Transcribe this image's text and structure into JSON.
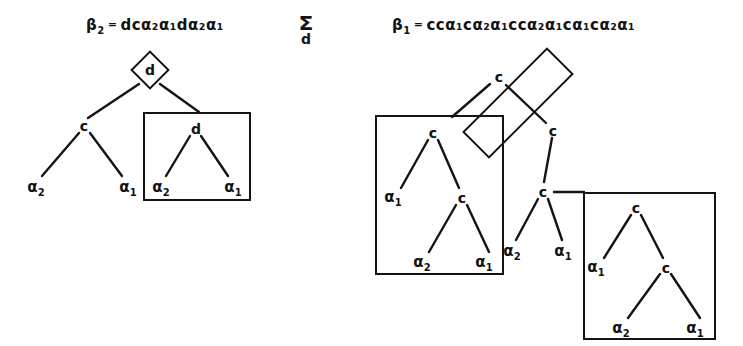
{
  "figure": {
    "left_diagram": {
      "equation": {
        "lhs": "β",
        "lhs_sub": "2",
        "equals": "=",
        "rhs": "dcα₂α₁dα₂α₁",
        "rhs_plain": "dca2a1da2a1"
      },
      "root_node": "d",
      "root_shape": "diamond",
      "nodes": [
        {
          "id": "L-root",
          "label": "d",
          "shape": "diamond"
        },
        {
          "id": "L-c",
          "label": "c",
          "shape": "plain"
        },
        {
          "id": "L-a2",
          "label": "α",
          "sub": "2",
          "shape": "leaf"
        },
        {
          "id": "L-a1",
          "label": "α",
          "sub": "1",
          "shape": "leaf"
        },
        {
          "id": "L-d",
          "label": "d",
          "shape": "plain"
        },
        {
          "id": "L-b-a2",
          "label": "α",
          "sub": "2",
          "shape": "leaf"
        },
        {
          "id": "L-b-a1",
          "label": "α",
          "sub": "1",
          "shape": "leaf"
        }
      ],
      "boxes": [
        {
          "id": "L-box-d",
          "rotation": 0,
          "contains": "d subtree"
        }
      ]
    },
    "sigma": {
      "glyph": "Σ",
      "subscript": "d"
    },
    "right_diagram": {
      "equation": {
        "lhs": "β",
        "lhs_sub": "1",
        "equals": "=",
        "rhs": "ccα₁cα₂α₁ccα₂α₁cα₁cα₂α₁",
        "rhs_plain": "cca1ca2a1cca2a1ca1ca2a1"
      },
      "nodes": [
        {
          "id": "R-top-c",
          "label": "c",
          "shape": "plain"
        },
        {
          "id": "R-rot-c",
          "label": "c",
          "shape": "plain"
        },
        {
          "id": "R-boxL-c",
          "label": "c",
          "shape": "plain"
        },
        {
          "id": "R-boxL-a1",
          "label": "α",
          "sub": "1",
          "shape": "leaf"
        },
        {
          "id": "R-boxL-c2",
          "label": "c",
          "shape": "plain"
        },
        {
          "id": "R-boxL-a2",
          "label": "α",
          "sub": "2",
          "shape": "leaf"
        },
        {
          "id": "R-boxL-a1b",
          "label": "α",
          "sub": "1",
          "shape": "leaf"
        },
        {
          "id": "R-mid-c",
          "label": "c",
          "shape": "plain"
        },
        {
          "id": "R-mid-a2",
          "label": "α",
          "sub": "2",
          "shape": "leaf"
        },
        {
          "id": "R-mid-a1",
          "label": "α",
          "sub": "1",
          "shape": "leaf"
        },
        {
          "id": "R-boxR-c",
          "label": "c",
          "shape": "plain"
        },
        {
          "id": "R-boxR-a1",
          "label": "α",
          "sub": "1",
          "shape": "leaf"
        },
        {
          "id": "R-boxR-c2",
          "label": "c",
          "shape": "plain"
        },
        {
          "id": "R-boxR-a2",
          "label": "α",
          "sub": "2",
          "shape": "leaf"
        },
        {
          "id": "R-boxR-a1b",
          "label": "α",
          "sub": "1",
          "shape": "leaf"
        }
      ],
      "boxes": [
        {
          "id": "R-rotbox",
          "rotation": -45,
          "contains": "c c rotated subtree"
        },
        {
          "id": "R-box-left",
          "rotation": 0,
          "contains": "c subtree"
        },
        {
          "id": "R-box-right",
          "rotation": 0,
          "contains": "c subtree"
        }
      ]
    }
  },
  "labels": {
    "c": "c",
    "d": "d",
    "alpha": "α",
    "sub1": "1",
    "sub2": "2"
  },
  "colors": {
    "ink": "#141414",
    "background": "#ffffff"
  }
}
